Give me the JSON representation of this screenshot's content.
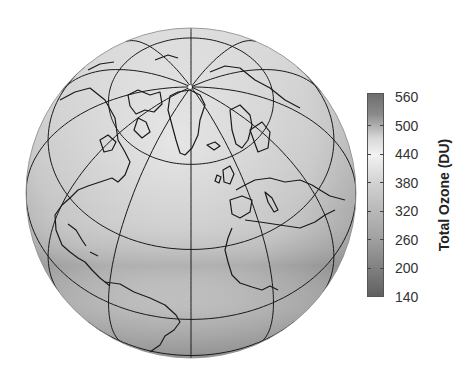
{
  "chart_data": {
    "type": "heatmap",
    "subtype": "orthographic-globe-map",
    "title": "",
    "projection": {
      "type": "orthographic",
      "center_lat": 50,
      "center_lon": -30
    },
    "graticule": {
      "lat_step": 30,
      "lon_step": 30
    },
    "region_shown": "North Atlantic, Arctic, Europe, North & South America, Africa",
    "colorbar": {
      "label": "Total Ozone (DU)",
      "ticks": [
        560,
        500,
        440,
        380,
        320,
        260,
        200,
        140
      ],
      "range": [
        140,
        560
      ],
      "colormap": "grayscale (dark at extremes, light at ~440)",
      "orientation": "vertical",
      "position": "right"
    },
    "field_description": [
      {
        "region": "high latitudes / polar",
        "approx_value": 440
      },
      {
        "region": "mid latitudes",
        "approx_value": 380
      },
      {
        "region": "tropics",
        "approx_value": 300
      }
    ]
  },
  "colors": {
    "background": "#ffffff",
    "globe_light": "#e4e4e4",
    "globe_mid": "#bdbdbd",
    "globe_dark": "#8e8e8e",
    "lines": "#1a1a1a"
  }
}
